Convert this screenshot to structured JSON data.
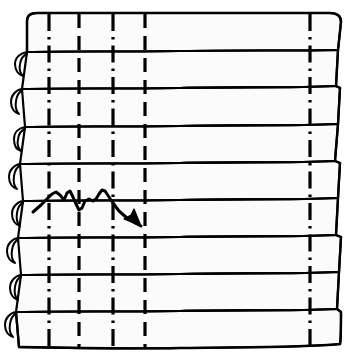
{
  "figure": {
    "title": "Stacked Band Technical Drawing",
    "canvas": {
      "width": 352,
      "height": 361,
      "background_color": "#ffffff",
      "band_fill_color": "#fbfbfb",
      "ink_color": "#000000"
    },
    "bands": {
      "count": 9,
      "label": "horizontal-band",
      "stroke_width": 2.2,
      "rows": [
        {
          "index": 0,
          "top": 13,
          "bottom": 51,
          "left": 26,
          "right": 340
        },
        {
          "index": 1,
          "top": 51,
          "bottom": 88,
          "left": 20,
          "right": 337
        },
        {
          "index": 2,
          "top": 88,
          "bottom": 126,
          "left": 23,
          "right": 340
        },
        {
          "index": 3,
          "top": 126,
          "bottom": 163,
          "left": 18,
          "right": 337
        },
        {
          "index": 4,
          "top": 163,
          "bottom": 200,
          "left": 21,
          "right": 341
        },
        {
          "index": 5,
          "top": 200,
          "bottom": 237,
          "left": 17,
          "right": 338
        },
        {
          "index": 6,
          "top": 237,
          "bottom": 274,
          "left": 20,
          "right": 341
        },
        {
          "index": 7,
          "top": 274,
          "bottom": 311,
          "left": 15,
          "right": 338
        },
        {
          "index": 8,
          "top": 311,
          "bottom": 348,
          "left": 18,
          "right": 340
        }
      ]
    },
    "vertical_lines": [
      {
        "index": 0,
        "name": "guide-line-1",
        "x": 49,
        "style": "dash-dot",
        "top": 14,
        "bottom": 348
      },
      {
        "index": 1,
        "name": "guide-line-2",
        "x": 79,
        "style": "dashed",
        "top": 14,
        "bottom": 348
      },
      {
        "index": 2,
        "name": "guide-line-3",
        "x": 113,
        "style": "dash-dot",
        "top": 14,
        "bottom": 348
      },
      {
        "index": 3,
        "name": "guide-line-4",
        "x": 145,
        "style": "dashed",
        "top": 14,
        "bottom": 348
      },
      {
        "index": 4,
        "name": "guide-line-5",
        "x": 310,
        "style": "dash-dot",
        "top": 14,
        "bottom": 348
      }
    ],
    "left_curls": {
      "count": 8,
      "label": "left-edge-curl",
      "note": "small hooked fold at the left end of each band below the topmost"
    },
    "annotation": {
      "name": "zigzag-arrow",
      "kind": "hand-drawn-arrow",
      "stroke_width": 3.0,
      "start": {
        "x": 33,
        "y": 212
      },
      "end": {
        "x": 141,
        "y": 226
      },
      "points": "33,212 47,198 55,193 62,197 66,191 71,196 74,205 78,210 81,207 85,199 91,201 95,200 99,193 103,190 107,195 112,204 120,212 129,219 141,226",
      "arrowhead": {
        "tip": {
          "x": 141,
          "y": 226
        },
        "wing_a": {
          "x": 126,
          "y": 220
        },
        "wing_b": {
          "x": 135,
          "y": 211
        }
      }
    }
  }
}
